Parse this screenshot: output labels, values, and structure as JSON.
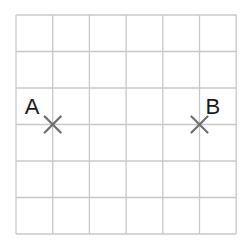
{
  "grid": {
    "columns": 6,
    "rows": 6,
    "origin_x": 16,
    "origin_y": 15,
    "cell_width": 36.7,
    "cell_height": 36.5,
    "line_color": "#c8c8c8"
  },
  "points": [
    {
      "label": "A",
      "grid_col": 1,
      "grid_row": 3,
      "marker": "cross-icon",
      "marker_color": "#6e6e6e",
      "label_position": "upper-left"
    },
    {
      "label": "B",
      "grid_col": 5,
      "grid_row": 3,
      "marker": "cross-icon",
      "marker_color": "#6e6e6e",
      "label_position": "upper-right"
    }
  ]
}
